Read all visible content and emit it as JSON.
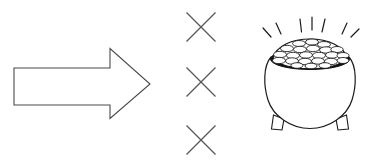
{
  "canvas": {
    "width": 370,
    "height": 164,
    "background_color": "#ffffff",
    "style": "black-and-white line art clipart"
  },
  "palette": {
    "outline": "#1a1a1a",
    "arrow_outline": "#4a4a4a",
    "x_mark": "#585858",
    "rim_fill": "#121212",
    "fill": "#ffffff"
  },
  "elements": {
    "arrow": {
      "name": "right-pointing block arrow",
      "direction": "right",
      "fill": "#ffffff",
      "outline_color": "#4a4a4a",
      "bbox": {
        "x": 14,
        "y": 48,
        "width": 136,
        "height": 70
      },
      "points": "14,68 110,68 110,48 150,84 110,118 110,105 14,105"
    },
    "x_marks": {
      "name": "x-mark column",
      "count": 3,
      "color": "#585858",
      "size": 30,
      "marks": [
        {
          "label": "x-mark-top",
          "cx": 201,
          "cy": 27,
          "half": 15
        },
        {
          "label": "x-mark-middle",
          "cx": 201,
          "cy": 82,
          "half": 15
        },
        {
          "label": "x-mark-bottom",
          "cx": 201,
          "cy": 140,
          "half": 15
        }
      ]
    },
    "pot_of_gold": {
      "name": "pot of gold with coins and sparkles",
      "bbox": {
        "x": 258,
        "y": 16,
        "width": 104,
        "height": 116
      },
      "body": {
        "label": "round cauldron body",
        "cx": 310,
        "cy": 90,
        "rx": 46,
        "ry": 41,
        "fill": "#ffffff",
        "outline": "#1a1a1a"
      },
      "rim": {
        "label": "dark pot rim ellipse",
        "cx": 310,
        "cy": 58,
        "rx": 39,
        "ry": 11,
        "fill": "#121212"
      },
      "legs": {
        "label": "pot legs",
        "count": 2,
        "left": {
          "x": 275,
          "y": 116
        },
        "right": {
          "x": 337,
          "y": 116
        }
      },
      "coins": {
        "label": "pile of gold coins",
        "count": 22,
        "fill": "#ffffff",
        "outline": "#141414"
      },
      "sparkles": {
        "label": "radiating shine lines",
        "groups": [
          {
            "label": "left-sparkles",
            "count": 2
          },
          {
            "label": "center-sparkles",
            "count": 3
          },
          {
            "label": "right-sparkles",
            "count": 2
          }
        ],
        "total": 7,
        "color": "#1a1a1a"
      }
    }
  }
}
